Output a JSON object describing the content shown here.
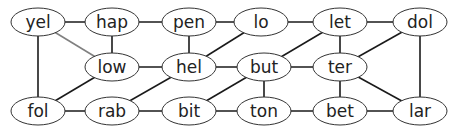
{
  "diagram": {
    "type": "graph",
    "node_style": {
      "rx": 27,
      "ry": 14
    },
    "colors": {
      "edge": "#1a1a1a",
      "edge_light": "#808080",
      "node_stroke": "#333333",
      "node_fill": "#ffffff"
    },
    "nodes": [
      {
        "id": "yel",
        "label": "yel",
        "x": 38,
        "y": 22
      },
      {
        "id": "hap",
        "label": "hap",
        "x": 112,
        "y": 22
      },
      {
        "id": "pen",
        "label": "pen",
        "x": 189,
        "y": 22
      },
      {
        "id": "lo",
        "label": "lo",
        "x": 261,
        "y": 22
      },
      {
        "id": "let",
        "label": "let",
        "x": 340,
        "y": 22
      },
      {
        "id": "dol",
        "label": "dol",
        "x": 420,
        "y": 22
      },
      {
        "id": "low",
        "label": "low",
        "x": 112,
        "y": 67
      },
      {
        "id": "hel",
        "label": "hel",
        "x": 189,
        "y": 67
      },
      {
        "id": "but",
        "label": "but",
        "x": 264,
        "y": 67
      },
      {
        "id": "ter",
        "label": "ter",
        "x": 340,
        "y": 67
      },
      {
        "id": "fol",
        "label": "fol",
        "x": 38,
        "y": 111
      },
      {
        "id": "rab",
        "label": "rab",
        "x": 112,
        "y": 111
      },
      {
        "id": "bit",
        "label": "bit",
        "x": 189,
        "y": 111
      },
      {
        "id": "ton",
        "label": "ton",
        "x": 264,
        "y": 111
      },
      {
        "id": "bet",
        "label": "bet",
        "x": 340,
        "y": 111
      },
      {
        "id": "lar",
        "label": "lar",
        "x": 420,
        "y": 111
      }
    ],
    "edges": [
      {
        "from": "yel",
        "to": "hap"
      },
      {
        "from": "hap",
        "to": "pen"
      },
      {
        "from": "pen",
        "to": "lo"
      },
      {
        "from": "lo",
        "to": "let"
      },
      {
        "from": "let",
        "to": "dol"
      },
      {
        "from": "yel",
        "to": "low",
        "style": "light"
      },
      {
        "from": "hap",
        "to": "low"
      },
      {
        "from": "yel",
        "to": "fol"
      },
      {
        "from": "pen",
        "to": "hel"
      },
      {
        "from": "hel",
        "to": "lo"
      },
      {
        "from": "low",
        "to": "hel"
      },
      {
        "from": "hel",
        "to": "but"
      },
      {
        "from": "but",
        "to": "let"
      },
      {
        "from": "but",
        "to": "ter"
      },
      {
        "from": "let",
        "to": "ter"
      },
      {
        "from": "ter",
        "to": "dol"
      },
      {
        "from": "dol",
        "to": "lar"
      },
      {
        "from": "low",
        "to": "fol"
      },
      {
        "from": "hel",
        "to": "rab"
      },
      {
        "from": "fol",
        "to": "rab"
      },
      {
        "from": "rab",
        "to": "bit"
      },
      {
        "from": "bit",
        "to": "but"
      },
      {
        "from": "but",
        "to": "ton"
      },
      {
        "from": "bit",
        "to": "ton"
      },
      {
        "from": "ton",
        "to": "bet"
      },
      {
        "from": "ter",
        "to": "bet"
      },
      {
        "from": "ter",
        "to": "lar"
      },
      {
        "from": "bet",
        "to": "lar"
      }
    ]
  }
}
